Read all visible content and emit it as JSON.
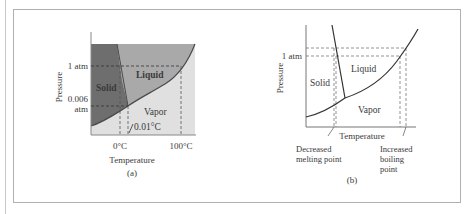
{
  "figure": {
    "panel_a": {
      "caption": "(a)",
      "x_label": "Temperature",
      "y_label": "Pressure",
      "y_ticks": [
        "1 atm",
        "0.006",
        "atm"
      ],
      "x_ticks": [
        "0°C",
        "100°C"
      ],
      "regions": [
        "Solid",
        "Liquid",
        "Vapor"
      ],
      "annotation": "0.01°C",
      "colors": {
        "solid": "#6e6e6e",
        "liquid": "#a9a9a9",
        "vapor": "#e0e0e0"
      }
    },
    "panel_b": {
      "caption": "(b)",
      "x_label": "Temperature",
      "y_label": "Pressure",
      "y_ticks": [
        "1 atm"
      ],
      "regions": [
        "Solid",
        "Liquid",
        "Vapor"
      ],
      "annotations": {
        "left_line1": "Decreased",
        "left_line2": "melting point",
        "right_line1": "Increased",
        "right_line2": "boiling",
        "right_line3": "point"
      }
    }
  }
}
